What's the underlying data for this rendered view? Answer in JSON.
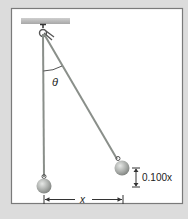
{
  "figure": {
    "angle_label": "θ",
    "separation_label": "x",
    "height_label": "0.100x",
    "colors": {
      "background": "#dcdcdc",
      "panel": "#ffffff",
      "panel_border": "#7a7a7a",
      "ceiling": "#b8b8b8",
      "string": "#8a8f8a",
      "bob": "#a9aca9",
      "text": "#222222"
    }
  }
}
